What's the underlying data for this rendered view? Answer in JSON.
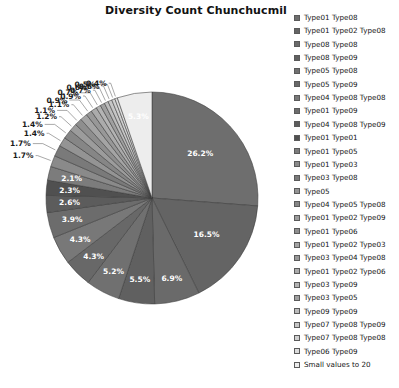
{
  "chart_data": {
    "type": "pie",
    "title": "Diversity Count Chunchucmil",
    "xlabel": "",
    "ylabel": "",
    "legend_position": "right",
    "grid": false,
    "start_angle_deg": 0,
    "direction": "clockwise",
    "value_unit": "percent",
    "categories": [
      "Type01 Type08",
      "Type01 Type02 Type08",
      "Type08 Type08",
      "Type08 Type09",
      "Type05 Type08",
      "Type05 Type09",
      "Type04 Type08 Type08",
      "Type01 Type09",
      "Type04 Type08 Type09",
      "Type01 Type01",
      "Type01 Type05",
      "Type01 Type03",
      "Type03 Type08",
      "Type05",
      "Type04 Type05 Type08",
      "Type01 Type02 Type09",
      "Type01 Type06",
      "Type01 Type02 Type03",
      "Type03 Type04 Type08",
      "Type01 Type02 Type06",
      "Type03 Type09",
      "Type03 Type05",
      "Type09 Type09",
      "Type07 Type08 Type09",
      "Type07 Type08 Type08",
      "Type06 Type09",
      "Small values to 20"
    ],
    "values": [
      26.2,
      16.5,
      6.9,
      5.5,
      5.2,
      4.3,
      4.3,
      3.9,
      2.6,
      2.3,
      2.1,
      1.7,
      1.7,
      1.4,
      1.4,
      1.2,
      1.1,
      1.1,
      0.9,
      0.9,
      0.7,
      0.7,
      0.6,
      0.6,
      0.5,
      0.4,
      5.3
    ],
    "labels": [
      "26.2%",
      "16.5%",
      "6.9%",
      "5.5%",
      "5.2%",
      "4.3%",
      "4.3%",
      "3.9%",
      "2.6%",
      "2.3%",
      "2.1%",
      "1.7%",
      "1.7%",
      "1.4%",
      "1.4%",
      "1.2%",
      "1.1%",
      "1.1%",
      "0.9%",
      "0.9%",
      "0.7%",
      "0.7%",
      "0.6%",
      "0.6%",
      "0.5%",
      "0.4%",
      "5.3%"
    ],
    "colors": [
      "#6e6e6e",
      "#646464",
      "#6a6a6a",
      "#606060",
      "#707070",
      "#686868",
      "#787878",
      "#6c6c6c",
      "#5c5c5c",
      "#505050",
      "#7c7c7c",
      "#8a8a8a",
      "#7a7a7a",
      "#949494",
      "#868686",
      "#9c9c9c",
      "#8e8e8e",
      "#a4a4a4",
      "#989898",
      "#ababab",
      "#b4b4b4",
      "#a0a0a0",
      "#bcbcbc",
      "#c6c6c6",
      "#d0d0d0",
      "#dcdcdc",
      "#ededed"
    ],
    "label_placement": [
      "inside",
      "inside",
      "inside",
      "inside",
      "inside",
      "inside",
      "inside",
      "inside",
      "inside",
      "inside",
      "inside",
      "outside",
      "outside",
      "outside",
      "outside",
      "outside",
      "outside",
      "outside",
      "outside",
      "outside",
      "outside",
      "outside",
      "outside",
      "outside",
      "outside",
      "outside",
      "inside"
    ]
  },
  "chart": {
    "title": "Diversity Count Chunchucmil"
  }
}
